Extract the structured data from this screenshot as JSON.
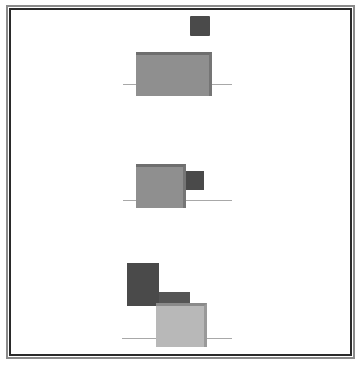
{
  "diagram": {
    "colors": {
      "frame_outer": "#8a8a8a",
      "frame_inner": "#2a2a2a",
      "medium_block": "#8f8f8f",
      "dark_block": "#4a4a4a",
      "light_block": "#b8b8b8",
      "baseline": "#a8a8a8"
    },
    "panels": [
      {
        "name": "top",
        "baseline": {
          "x1": 123,
          "x2": 232,
          "y": 84
        },
        "blocks": [
          {
            "shade": "dark",
            "x": 190,
            "y": 16,
            "w": 20,
            "h": 20
          },
          {
            "shade": "medium",
            "x": 136,
            "y": 52,
            "w": 76,
            "h": 44
          }
        ]
      },
      {
        "name": "middle",
        "baseline": {
          "x1": 123,
          "x2": 232,
          "y": 200
        },
        "blocks": [
          {
            "shade": "medium",
            "x": 136,
            "y": 164,
            "w": 50,
            "h": 44
          },
          {
            "shade": "dark",
            "x": 186,
            "y": 171,
            "w": 18,
            "h": 19
          }
        ]
      },
      {
        "name": "bottom",
        "baseline": {
          "x1": 122,
          "x2": 232,
          "y": 338
        },
        "blocks": [
          {
            "shade": "dark",
            "x": 127,
            "y": 263,
            "w": 32,
            "h": 43
          },
          {
            "shade": "dark",
            "x": 159,
            "y": 292,
            "w": 31,
            "h": 14
          },
          {
            "shade": "light",
            "x": 156,
            "y": 303,
            "w": 51,
            "h": 44
          }
        ]
      }
    ]
  }
}
